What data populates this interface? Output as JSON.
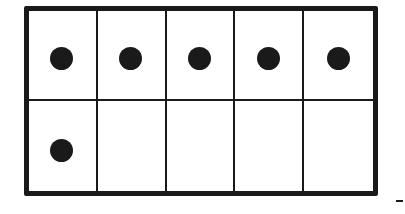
{
  "ten_frame": {
    "rows": 2,
    "columns": 5,
    "filled_count": 6,
    "cells": [
      {
        "row": 1,
        "col": 1,
        "filled": true
      },
      {
        "row": 1,
        "col": 2,
        "filled": true
      },
      {
        "row": 1,
        "col": 3,
        "filled": true
      },
      {
        "row": 1,
        "col": 4,
        "filled": true
      },
      {
        "row": 1,
        "col": 5,
        "filled": true
      },
      {
        "row": 2,
        "col": 1,
        "filled": true
      },
      {
        "row": 2,
        "col": 2,
        "filled": false
      },
      {
        "row": 2,
        "col": 3,
        "filled": false
      },
      {
        "row": 2,
        "col": 4,
        "filled": false
      },
      {
        "row": 2,
        "col": 5,
        "filled": false
      }
    ],
    "colors": {
      "line": "#1a1a1a",
      "dot": "#1a1a1a",
      "background": "#ffffff"
    }
  },
  "answer_blank": {
    "mark": "-"
  }
}
